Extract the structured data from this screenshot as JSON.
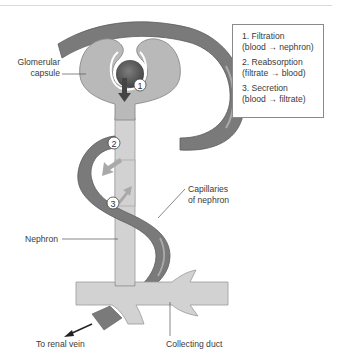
{
  "diagram": {
    "labels": {
      "glomerular_capsule_line1": "Glomerular",
      "glomerular_capsule_line2": "capsule",
      "capillaries_line1": "Capillaries",
      "capillaries_line2": "of nephron",
      "nephron": "Nephron",
      "renal_vein": "To renal vein",
      "collecting_duct": "Collecting duct"
    },
    "markers": [
      {
        "number": "1",
        "process": "Filtration"
      },
      {
        "number": "2",
        "process": "Reabsorption"
      },
      {
        "number": "3",
        "process": "Secretion"
      }
    ],
    "legend": [
      {
        "title": "1. Filtration",
        "detail": "(blood → nephron)"
      },
      {
        "title": "2. Reabsorption",
        "detail": "(filtrate → blood)"
      },
      {
        "title": "3. Secretion",
        "detail": "(blood → filtrate)"
      }
    ],
    "colors": {
      "capillary": "#7a7a7a",
      "capillary_highlight": "#a8a8a8",
      "capsule": "#b9b9b9",
      "nephron_tube": "#d2d2d2",
      "glomerulus": "#5a5a5a",
      "arrow": "#444444",
      "exchange_arrow": "#a9a9a9"
    }
  }
}
